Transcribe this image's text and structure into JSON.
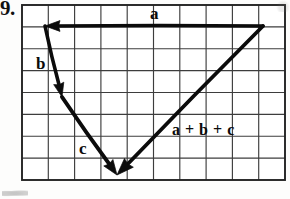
{
  "document": {
    "kind": "textbook-figure",
    "problem_number": "9."
  },
  "grid": {
    "columns": 10,
    "rows": 8,
    "left": 22,
    "top": 5,
    "right": 285,
    "bottom": 180,
    "cell_width": 26.3,
    "cell_height": 21.875,
    "line_color": "#3a3a3a",
    "border_color": "#262626",
    "background_color": "#ffffff"
  },
  "labels": {
    "a": "a",
    "b": "b",
    "c": "c",
    "sum": "a + b + c"
  },
  "ink_color": "#0b0b0b",
  "chart_data": {
    "type": "diagram",
    "grid": {
      "columns": 10,
      "rows": 8
    },
    "vectors": [
      {
        "name": "a",
        "label": "a",
        "start": {
          "x": 263,
          "y": 26
        },
        "end": {
          "x": 45,
          "y": 26
        },
        "grid_start": {
          "col": 9.2,
          "row": 1.0
        },
        "grid_end": {
          "col": 0.9,
          "row": 1.0
        },
        "components_cells": {
          "dx": -8.3,
          "dy": 0
        },
        "direction": "left",
        "arrowhead_at": "end",
        "label_position": {
          "x": 150,
          "y": 5
        }
      },
      {
        "name": "b",
        "label": "b",
        "start": {
          "x": 45,
          "y": 26
        },
        "end": {
          "x": 62,
          "y": 97
        },
        "grid_start": {
          "col": 0.9,
          "row": 1.0
        },
        "grid_end": {
          "col": 1.5,
          "row": 4.2
        },
        "components_cells": {
          "dx": 0.6,
          "dy": 3.2
        },
        "direction": "down-right-steep",
        "arrowhead_at": "end",
        "label_position": {
          "x": 36,
          "y": 55
        }
      },
      {
        "name": "c",
        "label": "c",
        "start": {
          "x": 62,
          "y": 97
        },
        "end": {
          "x": 117,
          "y": 175
        },
        "grid_start": {
          "col": 1.5,
          "row": 4.2
        },
        "grid_end": {
          "col": 3.6,
          "row": 7.8
        },
        "components_cells": {
          "dx": 2.1,
          "dy": 3.6
        },
        "direction": "down-right",
        "arrowhead_at": "end",
        "label_position": {
          "x": 79,
          "y": 140
        }
      },
      {
        "name": "resultant",
        "label": "a + b + c",
        "start": {
          "x": 263,
          "y": 26
        },
        "end": {
          "x": 117,
          "y": 175
        },
        "grid_start": {
          "col": 9.2,
          "row": 1.0
        },
        "grid_end": {
          "col": 3.6,
          "row": 7.8
        },
        "components_cells": {
          "dx": -5.6,
          "dy": 6.8
        },
        "direction": "down-left",
        "arrowhead_at": "end",
        "label_position": {
          "x": 172,
          "y": 122
        }
      }
    ],
    "vertices": [
      {
        "name": "top-right-origin",
        "x": 263,
        "y": 26
      },
      {
        "name": "top-left-corner",
        "x": 45,
        "y": 26
      },
      {
        "name": "mid-left-corner",
        "x": 62,
        "y": 97
      },
      {
        "name": "bottom-terminus",
        "x": 117,
        "y": 175
      }
    ]
  }
}
